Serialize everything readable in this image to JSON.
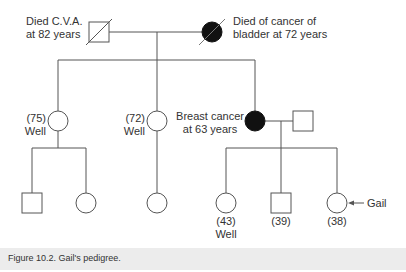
{
  "figure": {
    "caption": "Figure 10.2. Gail's pedigree.",
    "proband_arrow_label": "Gail"
  },
  "generation_1": {
    "grandfather": {
      "sex": "male",
      "deceased": true,
      "affected": false,
      "label_line1": "Died C.V.A.",
      "label_line2": "at 82 years"
    },
    "grandmother": {
      "sex": "female",
      "deceased": true,
      "affected": true,
      "label_line1": "Died of cancer of",
      "label_line2": "bladder at 72 years"
    }
  },
  "generation_2": [
    {
      "id": "aunt1",
      "sex": "female",
      "affected": false,
      "age": "(75)",
      "status": "Well"
    },
    {
      "id": "aunt2",
      "sex": "female",
      "affected": false,
      "age": "(72)",
      "status": "Well"
    },
    {
      "id": "mother",
      "sex": "female",
      "affected": true,
      "label_line1": "Breast cancer",
      "label_line2": "at 63 years"
    },
    {
      "id": "father",
      "sex": "male",
      "affected": false
    }
  ],
  "generation_3": [
    {
      "id": "cousin1",
      "sex": "male"
    },
    {
      "id": "cousin2",
      "sex": "female"
    },
    {
      "id": "cousin3",
      "sex": "female"
    },
    {
      "id": "sister",
      "sex": "female",
      "age": "(43)",
      "status": "Well"
    },
    {
      "id": "brother",
      "sex": "male",
      "age": "(39)"
    },
    {
      "id": "gail",
      "sex": "female",
      "age": "(38)",
      "proband": true
    }
  ],
  "colors": {
    "line": "#555555",
    "affected_fill": "#111111",
    "caption_bg": "#ececec"
  }
}
